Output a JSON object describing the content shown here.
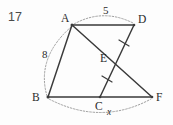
{
  "problem": {
    "number": "17"
  },
  "figure": {
    "vertices": [
      {
        "id": "A",
        "label": "A",
        "x": 72,
        "y": 25,
        "label_x": 61,
        "label_y": 22
      },
      {
        "id": "D",
        "label": "D",
        "x": 134,
        "y": 25,
        "label_x": 138,
        "label_y": 23
      },
      {
        "id": "B",
        "label": "B",
        "x": 48,
        "y": 97,
        "label_x": 32,
        "label_y": 101
      },
      {
        "id": "C",
        "label": "C",
        "x": 100,
        "y": 97,
        "label_x": 95,
        "label_y": 110
      },
      {
        "id": "F",
        "label": "F",
        "x": 152,
        "y": 97,
        "label_x": 156,
        "label_y": 101
      },
      {
        "id": "E",
        "label": "E",
        "x": 113,
        "y": 62,
        "label_x": 100,
        "label_y": 62
      }
    ],
    "segments": [
      {
        "name": "segment-AD",
        "from": "A",
        "to": "D"
      },
      {
        "name": "segment-AB",
        "from": "A",
        "to": "B"
      },
      {
        "name": "segment-AF",
        "from": "A",
        "to": "F"
      },
      {
        "name": "segment-BF",
        "from": "B",
        "to": "F"
      },
      {
        "name": "segment-CD",
        "from": "C",
        "to": "D"
      }
    ],
    "tick_marks": [
      {
        "name": "tick-segment-CE",
        "note": "congruence tick on CE"
      },
      {
        "name": "tick-segment-ED",
        "note": "congruence tick on ED"
      }
    ],
    "measures": [
      {
        "name": "measure-AD",
        "value": "5",
        "x": 103,
        "y": 14
      },
      {
        "name": "measure-AB",
        "value": "8",
        "x": 42,
        "y": 58
      },
      {
        "name": "measure-BF",
        "value": "x",
        "x": 107,
        "y": 115
      }
    ],
    "arcs": [
      {
        "name": "arc-AD",
        "from": "A",
        "to": "D",
        "bulge": "up"
      },
      {
        "name": "arc-AB",
        "from": "A",
        "to": "B",
        "bulge": "left"
      },
      {
        "name": "arc-BF",
        "from": "B",
        "to": "F",
        "bulge": "down"
      }
    ]
  }
}
